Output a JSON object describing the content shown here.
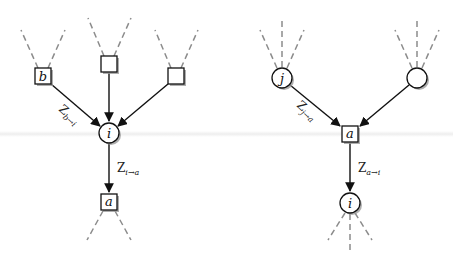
{
  "figure": {
    "colors": {
      "edge": "#111111",
      "dashed_edge": "#8c8c8c",
      "node_fill": "#ffffff",
      "node_stroke": "#111111",
      "shadow": "#9a9a9a"
    }
  },
  "left_panel": {
    "nodes": {
      "factor_b": {
        "shape": "square",
        "label": "b"
      },
      "factor_mid": {
        "shape": "square",
        "label": ""
      },
      "factor_right": {
        "shape": "square",
        "label": ""
      },
      "variable_i": {
        "shape": "circle",
        "label": "i"
      },
      "factor_a": {
        "shape": "square",
        "label": "a"
      }
    },
    "messages": {
      "b_to_i": {
        "base": "Z",
        "sub": "b→i"
      },
      "i_to_a": {
        "base": "Z",
        "sub": "i→a"
      }
    }
  },
  "right_panel": {
    "nodes": {
      "variable_j": {
        "shape": "circle",
        "label": "j"
      },
      "variable_right": {
        "shape": "circle",
        "label": ""
      },
      "factor_a": {
        "shape": "square",
        "label": "a"
      },
      "variable_i": {
        "shape": "circle",
        "label": "i"
      }
    },
    "messages": {
      "j_to_a": {
        "base": "Z",
        "sub": "j→a"
      },
      "a_to_i": {
        "base": "Z",
        "sub": "a→i"
      }
    }
  }
}
